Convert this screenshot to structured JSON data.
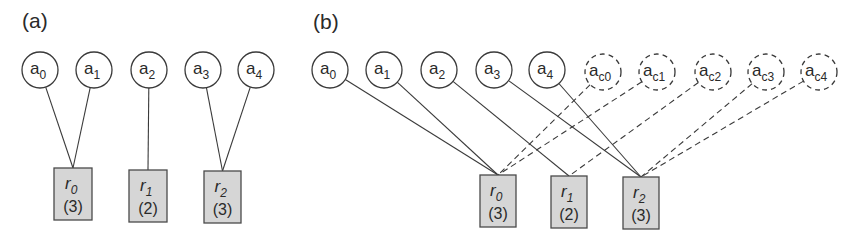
{
  "colors": {
    "stroke": "#3a3a3a",
    "resource_fill": "#d6d6d6",
    "resource_border": "#4a4a4a",
    "background": "#ffffff"
  },
  "panels": [
    {
      "id": "a",
      "label": "(a)",
      "label_pos": [
        22,
        28
      ],
      "agents": [
        {
          "name": "a",
          "sub": "0",
          "cx": 40,
          "cy": 70,
          "r": 18,
          "dashed": false,
          "target": 0
        },
        {
          "name": "a",
          "sub": "1",
          "cx": 94,
          "cy": 70,
          "r": 18,
          "dashed": false,
          "target": 0
        },
        {
          "name": "a",
          "sub": "2",
          "cx": 149,
          "cy": 70,
          "r": 18,
          "dashed": false,
          "target": 1
        },
        {
          "name": "a",
          "sub": "3",
          "cx": 203,
          "cy": 70,
          "r": 18,
          "dashed": false,
          "target": 2
        },
        {
          "name": "a",
          "sub": "4",
          "cx": 256,
          "cy": 70,
          "r": 18,
          "dashed": false,
          "target": 2
        }
      ],
      "resources": [
        {
          "name": "r",
          "sub": "0",
          "capacity": "(3)",
          "x": 54,
          "y": 168,
          "w": 38,
          "h": 52
        },
        {
          "name": "r",
          "sub": "1",
          "capacity": "(2)",
          "x": 129,
          "y": 170,
          "w": 38,
          "h": 52
        },
        {
          "name": "r",
          "sub": "2",
          "capacity": "(3)",
          "x": 204,
          "y": 171,
          "w": 37,
          "h": 52
        }
      ]
    },
    {
      "id": "b",
      "label": "(b)",
      "label_pos": [
        313,
        29
      ],
      "agents": [
        {
          "name": "a",
          "sub": "0",
          "cx": 330,
          "cy": 70,
          "r": 18,
          "dashed": false,
          "target": 0
        },
        {
          "name": "a",
          "sub": "1",
          "cx": 384,
          "cy": 70,
          "r": 18,
          "dashed": false,
          "target": 0
        },
        {
          "name": "a",
          "sub": "2",
          "cx": 439,
          "cy": 70,
          "r": 18,
          "dashed": false,
          "target": 1
        },
        {
          "name": "a",
          "sub": "3",
          "cx": 494,
          "cy": 70,
          "r": 18,
          "dashed": false,
          "target": 2
        },
        {
          "name": "a",
          "sub": "4",
          "cx": 547,
          "cy": 70,
          "r": 18,
          "dashed": false,
          "target": 2
        },
        {
          "name": "a",
          "sub": "c0",
          "cx": 603,
          "cy": 72,
          "r": 18,
          "dashed": true,
          "target": 0
        },
        {
          "name": "a",
          "sub": "c1",
          "cx": 657,
          "cy": 72,
          "r": 18,
          "dashed": true,
          "target": 0
        },
        {
          "name": "a",
          "sub": "c2",
          "cx": 713,
          "cy": 72,
          "r": 18,
          "dashed": true,
          "target": 1
        },
        {
          "name": "a",
          "sub": "c3",
          "cx": 766,
          "cy": 72,
          "r": 18,
          "dashed": true,
          "target": 2
        },
        {
          "name": "a",
          "sub": "c4",
          "cx": 819,
          "cy": 72,
          "r": 18,
          "dashed": true,
          "target": 2
        }
      ],
      "resources": [
        {
          "name": "r",
          "sub": "0",
          "capacity": "(3)",
          "x": 480,
          "y": 175,
          "w": 36,
          "h": 52
        },
        {
          "name": "r",
          "sub": "1",
          "capacity": "(2)",
          "x": 551,
          "y": 176,
          "w": 36,
          "h": 52
        },
        {
          "name": "r",
          "sub": "2",
          "capacity": "(3)",
          "x": 623,
          "y": 177,
          "w": 36,
          "h": 52
        }
      ]
    }
  ]
}
